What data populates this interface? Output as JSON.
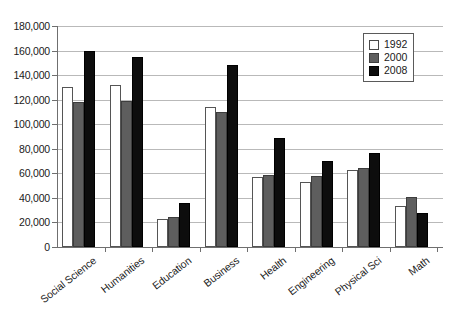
{
  "chart_data": {
    "type": "bar",
    "title": "",
    "xlabel": "",
    "ylabel": "",
    "ylim": [
      0,
      180000
    ],
    "grid": true,
    "legend_position": "top-right",
    "categories": [
      "Social Science",
      "Humanities",
      "Education",
      "Business",
      "Health",
      "Engineering",
      "Physical Sci",
      "Math"
    ],
    "ytick_labels": [
      "180,000",
      "160,000",
      "140,000",
      "120,000",
      "100,000",
      "80,000",
      "60,000",
      "40,000",
      "20,000",
      "0"
    ],
    "ytick_values": [
      180000,
      160000,
      140000,
      120000,
      100000,
      80000,
      60000,
      40000,
      20000,
      0
    ],
    "series": [
      {
        "name": "1992",
        "color": "#ffffff",
        "values": [
          130000,
          132000,
          23000,
          114000,
          57000,
          53000,
          63000,
          33000
        ]
      },
      {
        "name": "2000",
        "color": "#5e5e5e",
        "values": [
          118000,
          119000,
          24500,
          110000,
          59000,
          58000,
          64500,
          41000
        ]
      },
      {
        "name": "2008",
        "color": "#0d0d0d",
        "values": [
          159500,
          155000,
          35500,
          148000,
          89000,
          70000,
          76500,
          28000
        ]
      }
    ]
  },
  "legend": {
    "entries": [
      {
        "label": "1992",
        "swatch": "white-square-icon"
      },
      {
        "label": "2000",
        "swatch": "gray-square-icon"
      },
      {
        "label": "2008",
        "swatch": "black-square-icon"
      }
    ]
  }
}
